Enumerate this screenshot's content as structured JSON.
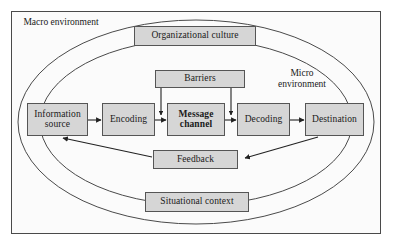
{
  "diagram": {
    "type": "process-flow",
    "frame": {
      "border_color": "#4a4a4a",
      "background": "#fbfbfb"
    },
    "environments": [
      {
        "id": "macro",
        "label": "Macro\nenvironment",
        "line1": "Macro",
        "line2": "environment"
      },
      {
        "id": "micro",
        "label": "Micro\nenvironment",
        "line1": "Micro",
        "line2": "environment"
      }
    ],
    "context_boxes": [
      {
        "id": "organizational-culture",
        "label": "Organizational culture"
      },
      {
        "id": "situational-context",
        "label": "Situational context"
      }
    ],
    "nodes": [
      {
        "id": "information-source",
        "line1": "Information",
        "line2": "source",
        "bold": false
      },
      {
        "id": "encoding",
        "line1": "Encoding",
        "line2": "",
        "bold": false
      },
      {
        "id": "message-channel",
        "line1": "Message",
        "line2": "channel",
        "bold": true
      },
      {
        "id": "decoding",
        "line1": "Decoding",
        "line2": "",
        "bold": false
      },
      {
        "id": "destination",
        "line1": "Destination",
        "line2": "",
        "bold": false
      },
      {
        "id": "barriers",
        "line1": "Barriers",
        "line2": "",
        "bold": false
      },
      {
        "id": "feedback",
        "line1": "Feedback",
        "line2": "",
        "bold": false
      }
    ],
    "flow_sequence": [
      "Information source",
      "Encoding",
      "Message channel",
      "Decoding",
      "Destination"
    ],
    "connections": [
      {
        "from": "information-source",
        "to": "encoding",
        "kind": "arrow"
      },
      {
        "from": "encoding",
        "to": "message-channel",
        "kind": "arrow"
      },
      {
        "from": "message-channel",
        "to": "decoding",
        "kind": "arrow"
      },
      {
        "from": "decoding",
        "to": "destination",
        "kind": "arrow"
      },
      {
        "from": "barriers",
        "to": "encoding-message-link",
        "kind": "arrow-down"
      },
      {
        "from": "barriers",
        "to": "message-decoding-link",
        "kind": "arrow-down"
      },
      {
        "from": "destination",
        "to": "feedback",
        "kind": "arrow"
      },
      {
        "from": "feedback",
        "to": "information-source",
        "kind": "arrow"
      }
    ],
    "colors": {
      "node_fill": "#d6d6d6",
      "node_border": "#555555",
      "line": "#333333",
      "text": "#1a1a1a",
      "ellipse_stroke": "#4a4a4a"
    }
  }
}
